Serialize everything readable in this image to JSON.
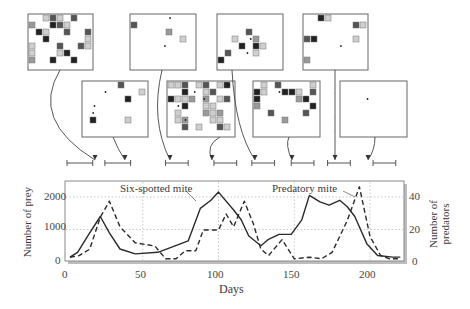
{
  "chart_data": {
    "type": "line",
    "title": "",
    "xlabel": "Days",
    "ylabel": "Number of prey",
    "ylabel_right": "Number of predators",
    "xlim": [
      0,
      220
    ],
    "ylim": [
      0,
      2300
    ],
    "ylim_right": [
      0,
      46
    ],
    "x_ticks": [
      0,
      50,
      100,
      150,
      200
    ],
    "y_ticks": [
      0,
      1000,
      2000
    ],
    "y_ticks_right": [
      0,
      20,
      40
    ],
    "grid": true,
    "annotations": [
      "Six-spotted mite",
      "Predatory mite"
    ],
    "series": [
      {
        "name": "Six-spotted mite",
        "axis": "left",
        "style": "solid",
        "x": [
          2,
          7,
          15,
          22,
          28,
          35,
          45,
          60,
          80,
          88,
          95,
          100,
          110,
          115,
          120,
          128,
          133,
          140,
          148,
          155,
          160,
          167,
          173,
          180,
          185,
          190,
          198,
          205,
          215,
          220
        ],
        "values": [
          150,
          300,
          900,
          1400,
          900,
          400,
          250,
          300,
          650,
          1650,
          1900,
          2150,
          1600,
          1300,
          800,
          500,
          700,
          850,
          850,
          1300,
          2050,
          1850,
          1750,
          1900,
          1700,
          1400,
          550,
          200,
          150,
          150
        ]
      },
      {
        "name": "Predatory mite",
        "axis": "right",
        "style": "dashed",
        "x": [
          2,
          8,
          15,
          22,
          28,
          35,
          45,
          58,
          65,
          72,
          78,
          85,
          90,
          100,
          105,
          110,
          117,
          123,
          128,
          133,
          142,
          150,
          160,
          168,
          175,
          185,
          193,
          200,
          207,
          213,
          220
        ],
        "values": [
          3,
          4,
          8,
          28,
          38,
          22,
          12,
          10,
          2,
          2,
          7,
          7,
          20,
          20,
          30,
          22,
          38,
          24,
          8,
          4,
          14,
          2,
          3,
          2,
          6,
          26,
          47,
          16,
          4,
          2,
          2
        ]
      }
    ]
  },
  "axes": {
    "x_title": "Days",
    "y_left_title": "Number of prey",
    "y_right_title_line1": "Number of",
    "y_right_title_line2": "predators",
    "x_tick_labels": [
      "0",
      "50",
      "100",
      "150",
      "200"
    ],
    "y_left_tick_labels": [
      "0",
      "1000",
      "2000"
    ],
    "y_right_tick_labels": [
      "0",
      "20",
      "40"
    ]
  },
  "annotations": {
    "prey_label": "Six-spotted mite",
    "predator_label": "Predatory mite"
  },
  "grid_panels": {
    "top_row_count": 4,
    "bottom_row_count": 4,
    "cell_colors": {
      "light": "#cfcfcf",
      "medium": "#9a9a9a",
      "dark": "#555555",
      "black": "#222222"
    }
  },
  "time_brackets": [
    {
      "start_day": 0,
      "end_day": 17
    },
    {
      "start_day": 25,
      "end_day": 42
    },
    {
      "start_day": 65,
      "end_day": 80
    },
    {
      "start_day": 97,
      "end_day": 112
    },
    {
      "start_day": 122,
      "end_day": 137
    },
    {
      "start_day": 148,
      "end_day": 163
    },
    {
      "start_day": 172,
      "end_day": 187
    },
    {
      "start_day": 202,
      "end_day": 217
    }
  ],
  "colors": {
    "line": "#2a2a2a",
    "frame": "#8a8a8a",
    "frame_shadow": "#b8b8b8",
    "grid": "#c8c8c8",
    "panel_border": "#666666"
  }
}
